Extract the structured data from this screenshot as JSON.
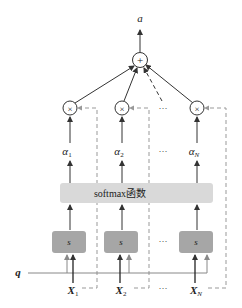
{
  "diagram": {
    "output_label": "a",
    "sum_symbol": "+",
    "multiply_symbol": "×",
    "ellipsis": "···",
    "softmax_label": "softmax函数",
    "score_label": "s",
    "query_label": "q",
    "columns": [
      {
        "alpha": "α",
        "alpha_sub": "1",
        "x": "X",
        "x_sub": "1"
      },
      {
        "alpha": "α",
        "alpha_sub": "2",
        "x": "X",
        "x_sub": "2"
      },
      {
        "alpha": "α",
        "alpha_sub": "N",
        "x": "X",
        "x_sub": "N"
      }
    ],
    "colors": {
      "line": "#444444",
      "dashed": "#999999",
      "softmax_fill": "#d9d9d9",
      "score_fill": "#a6a6a6"
    }
  }
}
